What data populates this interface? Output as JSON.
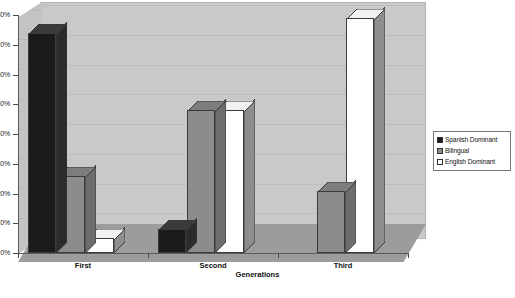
{
  "chart_data": {
    "type": "bar",
    "title": "",
    "xlabel": "Generations",
    "ylabel": "",
    "categories": [
      "First",
      "Second",
      "Third"
    ],
    "series": [
      {
        "name": "Spanish Dominant",
        "color": "#1b1b1b",
        "values": [
          74,
          8,
          0
        ]
      },
      {
        "name": "Bilingual",
        "color": "#8c8c8c",
        "values": [
          26,
          48,
          21
        ]
      },
      {
        "name": "English Dominant",
        "color": "#ffffff",
        "values": [
          5,
          48,
          79
        ]
      }
    ],
    "ylim": [
      0,
      80
    ],
    "ytick_values": [
      0,
      10,
      20,
      30,
      40,
      50,
      60,
      70,
      80
    ],
    "ytick_labels": [
      "0%",
      "10%",
      "20%",
      "30%",
      "40%",
      "50%",
      "60%",
      "70%",
      "80%"
    ],
    "grid": true,
    "legend_position": "right",
    "three_d": true
  },
  "axes": {
    "x_title": "Generations",
    "x_labels": [
      "First",
      "Second",
      "Third"
    ],
    "y_labels": [
      "80%",
      "70%",
      "60%",
      "50%",
      "40%",
      "30%",
      "20%",
      "10%",
      "0%"
    ]
  },
  "legend": {
    "items": [
      {
        "label": "Spanish Dominant",
        "color": "#1b1b1b"
      },
      {
        "label": "Bilingual",
        "color": "#8c8c8c"
      },
      {
        "label": "English Dominant",
        "color": "#ffffff"
      }
    ]
  },
  "colors": {
    "wall": "#c9c9c9",
    "floor": "#9c9c9c",
    "side_wall": "#c3c3c3",
    "gridline": "#bdbdbd",
    "axis": "#5a5a5a",
    "text": "#111111"
  }
}
